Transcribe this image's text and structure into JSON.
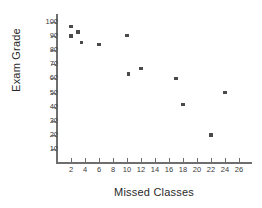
{
  "chart_data": {
    "type": "scatter",
    "title": "",
    "xlabel": "Missed Classes",
    "ylabel": "Exam Grade",
    "xlim": [
      0,
      28
    ],
    "ylim": [
      0,
      105
    ],
    "grid": false,
    "legend": false,
    "xticks": [
      2,
      4,
      6,
      8,
      10,
      12,
      14,
      16,
      18,
      20,
      22,
      24,
      26
    ],
    "yticks": [
      10,
      20,
      30,
      40,
      50,
      60,
      70,
      80,
      90,
      100
    ],
    "xtick_labels": [
      "2",
      "4",
      "6",
      "8",
      "10",
      "12",
      "14",
      "16",
      "18",
      "20",
      "22",
      "24",
      "26"
    ],
    "ytick_labels": [
      "10",
      "20",
      "30",
      "40",
      "50",
      "60",
      "70",
      "80",
      "90",
      "100"
    ],
    "marker": "square",
    "marker_color": "#4a4a4a",
    "axis_color": "#6e6e6e",
    "points": [
      {
        "x": 2,
        "y": 97
      },
      {
        "x": 2,
        "y": 90
      },
      {
        "x": 3,
        "y": 93
      },
      {
        "x": 3.5,
        "y": 85.5
      },
      {
        "x": 6,
        "y": 84
      },
      {
        "x": 10,
        "y": 90.5
      },
      {
        "x": 10.2,
        "y": 63
      },
      {
        "x": 12,
        "y": 67
      },
      {
        "x": 17,
        "y": 60
      },
      {
        "x": 18,
        "y": 41.5
      },
      {
        "x": 22,
        "y": 20
      },
      {
        "x": 24,
        "y": 50
      }
    ]
  }
}
